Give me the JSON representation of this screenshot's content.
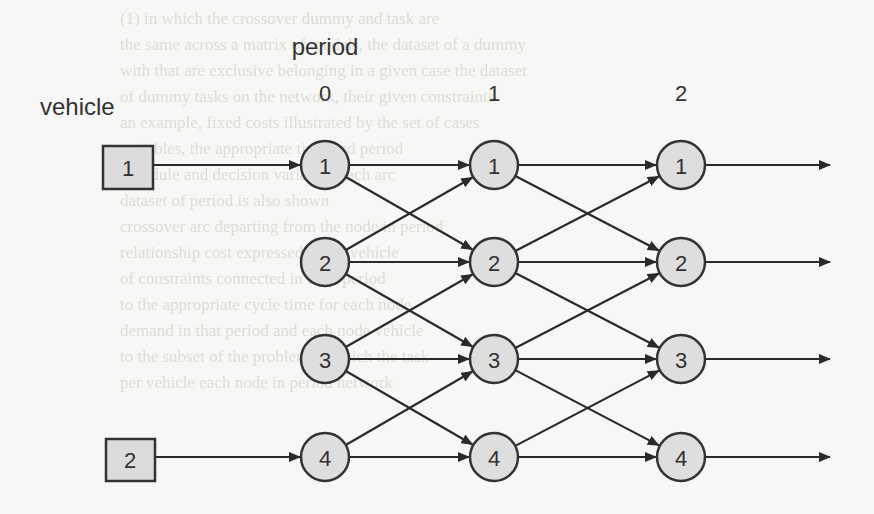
{
  "diagram": {
    "title": "period",
    "row_label": "vehicle",
    "periods": [
      {
        "label": "0",
        "x": 325
      },
      {
        "label": "1",
        "x": 494
      },
      {
        "label": "2",
        "x": 681
      }
    ],
    "rows": [
      {
        "label": "1",
        "y": 165
      },
      {
        "label": "2",
        "y": 262
      },
      {
        "label": "3",
        "y": 359
      },
      {
        "label": "4",
        "y": 457
      }
    ],
    "vehicles": [
      {
        "label": "1",
        "x": 103,
        "y": 146,
        "w": 50,
        "h": 43,
        "target_row": 0
      },
      {
        "label": "2",
        "x": 106,
        "y": 439,
        "w": 49,
        "h": 42,
        "target_row": 3
      }
    ],
    "period0_nodes": [
      "1",
      "2",
      "3",
      "4"
    ],
    "period1_nodes": [
      "1",
      "2",
      "3",
      "4"
    ],
    "period2_nodes": [
      "1",
      "2",
      "3",
      "4"
    ],
    "transitions": [
      {
        "from": 0,
        "to": 0
      },
      {
        "from": 0,
        "to": 1
      },
      {
        "from": 1,
        "to": 0
      },
      {
        "from": 1,
        "to": 1
      },
      {
        "from": 1,
        "to": 2
      },
      {
        "from": 2,
        "to": 1
      },
      {
        "from": 2,
        "to": 2
      },
      {
        "from": 2,
        "to": 3
      },
      {
        "from": 3,
        "to": 2
      },
      {
        "from": 3,
        "to": 3
      }
    ],
    "output_arrow_end_x": 830,
    "colors": {
      "node_fill": "#dedede",
      "stroke": "#333333",
      "background": "#f7f7f5",
      "ghost_text": "#dcdcd8"
    }
  },
  "background_text": {
    "lines": [
      "(1) in which the crossover dummy and task are",
      "the same across a matrix of models, the dataset of a dummy",
      "with that are exclusive belonging in a given case the dataset",
      "of dummy tasks on the network, their given constraints",
      "an example, fixed costs illustrated by the set of cases",
      "variables, the appropriate time and period",
      "schedule and decision variables each arc",
      "dataset of period is also shown",
      "crossover arc departing from the node in period",
      "relationship cost expressed to the vehicle",
      "of constraints connected in each period",
      "to the appropriate cycle time for each node",
      "demand in that period and each node vehicle",
      "to the subset of the problem in which the task",
      "per vehicle each node in period network"
    ]
  }
}
